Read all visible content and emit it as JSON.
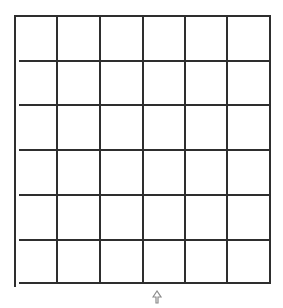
{
  "grid": {
    "rows": 6,
    "cols": 6,
    "line_color": "#2e2e2e",
    "line_width": 2,
    "col_x": [
      15,
      57,
      100,
      143,
      185,
      227,
      270
    ],
    "row_y": [
      16,
      61,
      105,
      150,
      195,
      240,
      283
    ],
    "left_border_bottom": 287,
    "inner_line_left_start": 19
  },
  "cursor": {
    "icon": "arrow-pointer-icon",
    "x": 152,
    "y": 289,
    "color": "#8a8a8a"
  }
}
